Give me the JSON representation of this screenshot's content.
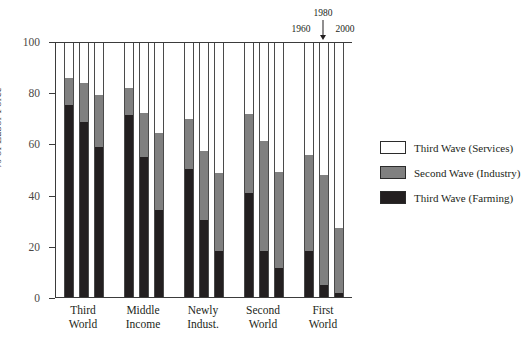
{
  "chart_data": {
    "type": "bar",
    "subtype": "stacked-grouped",
    "title": "",
    "xlabel": "",
    "ylabel": "% of Labor Force",
    "ylim": [
      0,
      100
    ],
    "yticks": [
      0,
      20,
      40,
      60,
      80,
      100
    ],
    "grid": false,
    "legend_position": "right",
    "categories": [
      "Third World",
      "Middle Income",
      "Newly Indust.",
      "Second World",
      "First World"
    ],
    "category_lines": [
      [
        "Third",
        "World"
      ],
      [
        "Middle",
        "Income"
      ],
      [
        "Newly",
        "Indust."
      ],
      [
        "Second",
        "World"
      ],
      [
        "First",
        "World"
      ]
    ],
    "subgroups": [
      "1960",
      "1980",
      "2000"
    ],
    "series": [
      {
        "name": "Third Wave (Farming)",
        "color": "#231f20",
        "values": [
          [
            75.0,
            68.5,
            58.5
          ],
          [
            71.0,
            54.5,
            34.0
          ],
          [
            50.0,
            30.0,
            18.0
          ],
          [
            40.5,
            18.0,
            11.5
          ],
          [
            18.0,
            4.5,
            1.5
          ]
        ]
      },
      {
        "name": "Second Wave (Industry)",
        "color": "#808080",
        "values": [
          [
            10.5,
            15.0,
            20.5
          ],
          [
            10.5,
            17.5,
            30.0
          ],
          [
            19.5,
            27.0,
            30.5
          ],
          [
            31.0,
            43.0,
            37.5
          ],
          [
            37.5,
            43.0,
            25.5
          ]
        ]
      },
      {
        "name": "Third Wave (Services)",
        "color": "#ffffff",
        "values": [
          [
            14.5,
            16.5,
            21.0
          ],
          [
            18.5,
            28.0,
            36.0
          ],
          [
            30.5,
            43.0,
            51.5
          ],
          [
            28.5,
            39.0,
            51.0
          ],
          [
            44.5,
            52.5,
            73.0
          ]
        ]
      }
    ],
    "cumulative_tops": [
      [
        [
          75.0,
          85.5
        ],
        [
          68.5,
          83.5
        ],
        [
          58.5,
          79.0
        ]
      ],
      [
        [
          71.0,
          81.5
        ],
        [
          54.5,
          72.0
        ],
        [
          34.0,
          64.0
        ]
      ],
      [
        [
          50.0,
          69.5
        ],
        [
          30.0,
          57.0
        ],
        [
          18.0,
          48.5
        ]
      ],
      [
        [
          40.5,
          71.5
        ],
        [
          18.0,
          61.0
        ],
        [
          11.5,
          49.0
        ]
      ],
      [
        [
          18.0,
          55.5
        ],
        [
          4.5,
          47.5
        ],
        [
          1.5,
          27.0
        ]
      ]
    ]
  },
  "axis": {
    "y_title": "% of Labor Force",
    "y_ticks": [
      "0",
      "20",
      "40",
      "60",
      "80",
      "100"
    ]
  },
  "annotations": {
    "year_left": "1960",
    "year_top": "1980",
    "year_right": "2000"
  },
  "legend": {
    "items": [
      {
        "label": "Third Wave (Services)",
        "swatch": "services"
      },
      {
        "label": "Second Wave (Industry)",
        "swatch": "industry"
      },
      {
        "label": "Third Wave (Farming)",
        "swatch": "farming"
      }
    ]
  },
  "colors": {
    "farming": "#231f20",
    "industry": "#808080",
    "services": "#ffffff",
    "axis": "#3b3b3b",
    "text": "#231f20",
    "tick_text": "#4b4845"
  }
}
